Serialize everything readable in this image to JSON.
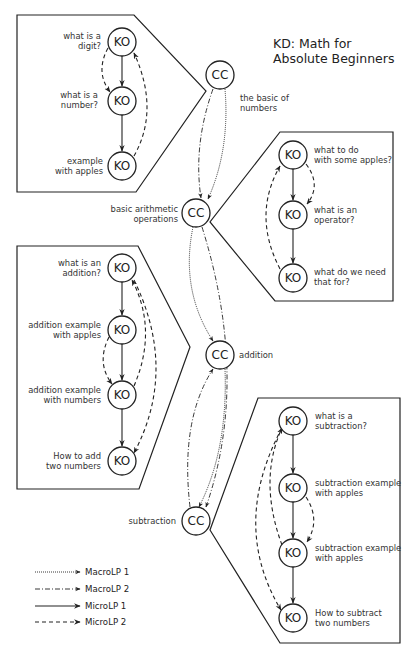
{
  "title": {
    "line1": "KD: Math for",
    "line2": "Absolute Beginners"
  },
  "concept_clusters": [
    {
      "id": "cc1",
      "node_label": "CC",
      "caption_line1": "the basic of",
      "caption_line2": "numbers"
    },
    {
      "id": "cc2",
      "node_label": "CC",
      "caption_line1": "basic arithmetic",
      "caption_line2": "operations"
    },
    {
      "id": "cc3",
      "node_label": "CC",
      "caption_line1": "addition",
      "caption_line2": ""
    },
    {
      "id": "cc4",
      "node_label": "CC",
      "caption_line1": "subtraction",
      "caption_line2": ""
    }
  ],
  "knowledge_objects": {
    "box1": [
      {
        "node_label": "KO",
        "line1": "what is a",
        "line2": "digit?"
      },
      {
        "node_label": "KO",
        "line1": "what is a",
        "line2": "number?"
      },
      {
        "node_label": "KO",
        "line1": "example",
        "line2": "with apples"
      }
    ],
    "box2": [
      {
        "node_label": "KO",
        "line1": "what to do",
        "line2": "with some apples?"
      },
      {
        "node_label": "KO",
        "line1": "what is an",
        "line2": "operator?"
      },
      {
        "node_label": "KO",
        "line1": "what do we need",
        "line2": "that for?"
      }
    ],
    "box3": [
      {
        "node_label": "KO",
        "line1": "what is an",
        "line2": "addition?"
      },
      {
        "node_label": "KO",
        "line1": "addition example",
        "line2": "with apples"
      },
      {
        "node_label": "KO",
        "line1": "addition example",
        "line2": "with numbers"
      },
      {
        "node_label": "KO",
        "line1": "How to add",
        "line2": "two numbers"
      }
    ],
    "box4": [
      {
        "node_label": "KO",
        "line1": "what is a",
        "line2": "subtraction?"
      },
      {
        "node_label": "KO",
        "line1": "subtraction example",
        "line2": "with apples"
      },
      {
        "node_label": "KO",
        "line1": "subtraction example",
        "line2": "with apples"
      },
      {
        "node_label": "KO",
        "line1": "How to subtract",
        "line2": "two numbers"
      }
    ]
  },
  "legend": [
    {
      "style": "dotted",
      "label": "MacroLP 1"
    },
    {
      "style": "dash-dot",
      "label": "MacroLP 2"
    },
    {
      "style": "solid",
      "label": "MicroLP 1"
    },
    {
      "style": "dashed",
      "label": "MicroLP 2"
    }
  ],
  "edges": {
    "macro": [
      {
        "from": "cc1",
        "to": "cc2",
        "path": "MacroLP 1"
      },
      {
        "from": "cc1",
        "to": "cc2",
        "path": "MacroLP 2"
      },
      {
        "from": "cc2",
        "to": "cc3",
        "path": "MacroLP 1"
      },
      {
        "from": "cc2",
        "to": "cc4",
        "path": "MacroLP 2"
      },
      {
        "from": "cc3",
        "to": "cc4",
        "path": "MacroLP 1"
      },
      {
        "from": "cc4",
        "to": "cc3",
        "path": "MacroLP 2"
      }
    ]
  }
}
